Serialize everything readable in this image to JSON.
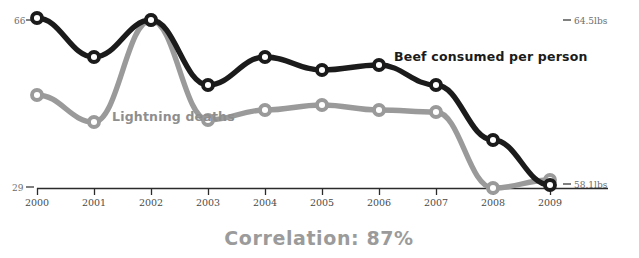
{
  "chart_data": {
    "type": "line",
    "title": "",
    "subtitle": "",
    "xlabel": "",
    "ylabel": "",
    "grid": false,
    "legend_position": "inline-annotation",
    "categories": [
      "2000",
      "2001",
      "2002",
      "2003",
      "2004",
      "2005",
      "2006",
      "2007",
      "2008",
      "2009"
    ],
    "x": [
      2000,
      2001,
      2002,
      2003,
      2004,
      2005,
      2006,
      2007,
      2008,
      2009
    ],
    "annotations": {
      "correlation": "Correlation: 87%",
      "left_axis_top": "66",
      "left_axis_bottom": "29",
      "right_axis_top": "64.5lbs",
      "right_axis_bottom": "58.1lbs"
    },
    "series": [
      {
        "name": "Beef consumed per person",
        "color": "#1b1b1b",
        "axis": "right",
        "unit": "lbs",
        "axis_min": 58.1,
        "axis_max": 64.5,
        "values": [
          64.5,
          63.0,
          66.0,
          61.2,
          62.6,
          61.9,
          62.0,
          61.3,
          59.9,
          58.1
        ],
        "pixel_y": [
          18,
          57,
          20,
          85,
          57,
          70,
          65,
          85,
          140,
          185
        ]
      },
      {
        "name": "Lightning deaths",
        "color": "#9a9a9a",
        "axis": "left",
        "unit": "deaths",
        "axis_min": 29,
        "axis_max": 66,
        "values": [
          51,
          44,
          66,
          44,
          44,
          45,
          44,
          44,
          29,
          31
        ],
        "pixel_y": [
          95,
          122,
          20,
          120,
          110,
          105,
          110,
          112,
          188,
          180
        ]
      }
    ],
    "x_pixels": [
      37,
      94,
      151,
      208,
      265,
      322,
      379,
      436,
      493,
      550
    ],
    "axis_baseline_y": 188,
    "colors": {
      "beef_line": "#1b1b1b",
      "lightning_line": "#9a9a9a",
      "axis": "#2b2b2b",
      "tick_text": "#4a4a4a",
      "correlation_text": "#9b9b9b",
      "background": "#ffffff"
    }
  },
  "labels": {
    "beef_series_label": "Beef consumed per person",
    "lightning_series_label": "Lightning deaths",
    "correlation": "Correlation: 87%",
    "left_top": "66",
    "left_bottom": "29",
    "right_top": "64.5lbs",
    "right_bottom": "58.1lbs"
  },
  "ticks": {
    "t0": "2000",
    "t1": "2001",
    "t2": "2002",
    "t3": "2003",
    "t4": "2004",
    "t5": "2005",
    "t6": "2006",
    "t7": "2007",
    "t8": "2008",
    "t9": "2009"
  }
}
